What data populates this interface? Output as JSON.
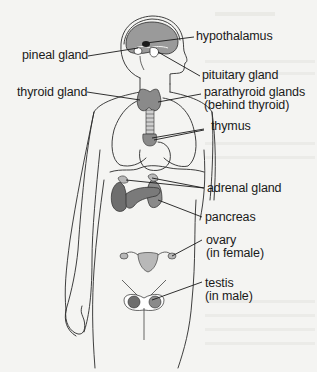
{
  "diagram": {
    "labels": {
      "hypothalamus": "hypothalamus",
      "pineal_gland": "pineal gland",
      "pituitary_gland": "pituitary gland",
      "thyroid_gland": "thyroid gland",
      "parathyroid_line1": "parathyroid glands",
      "parathyroid_line2": "(behind thyroid)",
      "thymus": "thymus",
      "adrenal_gland": "adrenal gland",
      "pancreas": "pancreas",
      "ovary_line1": "ovary",
      "ovary_line2": "(in female)",
      "testis_line1": "testis",
      "testis_line2": "(in male)"
    },
    "colors": {
      "background": "#f4f4f2",
      "outline": "#2a2a2a",
      "brain": "#9a9a9a",
      "gland_dark": "#6e6e6e",
      "gland_light": "#b8b8b8",
      "text": "#1a1a1a"
    }
  }
}
